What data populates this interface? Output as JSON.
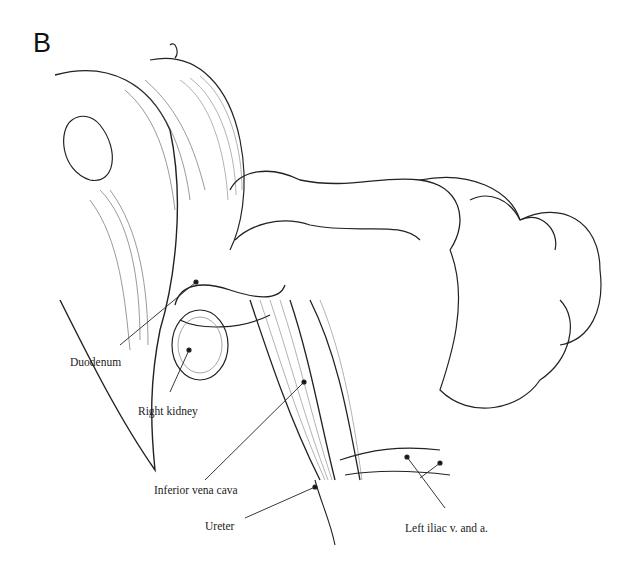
{
  "figure": {
    "panel_letter": "B",
    "labels": [
      {
        "id": "duodenum",
        "text": "Duodenum"
      },
      {
        "id": "right_kidney",
        "text": "Right kidney"
      },
      {
        "id": "inferior_vena_cava",
        "text": "Inferior vena cava"
      },
      {
        "id": "ureter",
        "text": "Ureter"
      },
      {
        "id": "left_iliac",
        "text": "Left iliac v. and a."
      }
    ]
  }
}
